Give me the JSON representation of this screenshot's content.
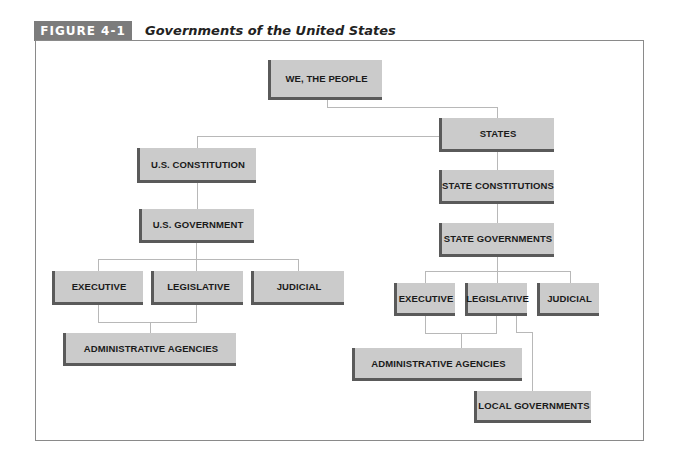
{
  "figure": {
    "label": "FIGURE 4-1",
    "title": "Governments of the United States"
  },
  "nodes": {
    "people": "WE, THE PEOPLE",
    "states": "STATES",
    "us_constitution": "U.S. CONSTITUTION",
    "us_government": "U.S. GOVERNMENT",
    "us_executive": "EXECUTIVE",
    "us_legislative": "LEGISLATIVE",
    "us_judicial": "JUDICIAL",
    "us_admin_agencies": "ADMINISTRATIVE AGENCIES",
    "state_constitutions": "STATE CONSTITUTIONS",
    "state_governments": "STATE GOVERNMENTS",
    "state_executive": "EXECUTIVE",
    "state_legislative": "LEGISLATIVE",
    "state_judicial": "JUDICIAL",
    "state_admin_agencies": "ADMINISTRATIVE AGENCIES",
    "local_governments": "LOCAL GOVERNMENTS"
  },
  "colors": {
    "box_fill": "#cbcbcb",
    "box_shadow": "#5a5a5a",
    "label_bar": "#7c7c7c",
    "connector": "#b8b8b8"
  }
}
